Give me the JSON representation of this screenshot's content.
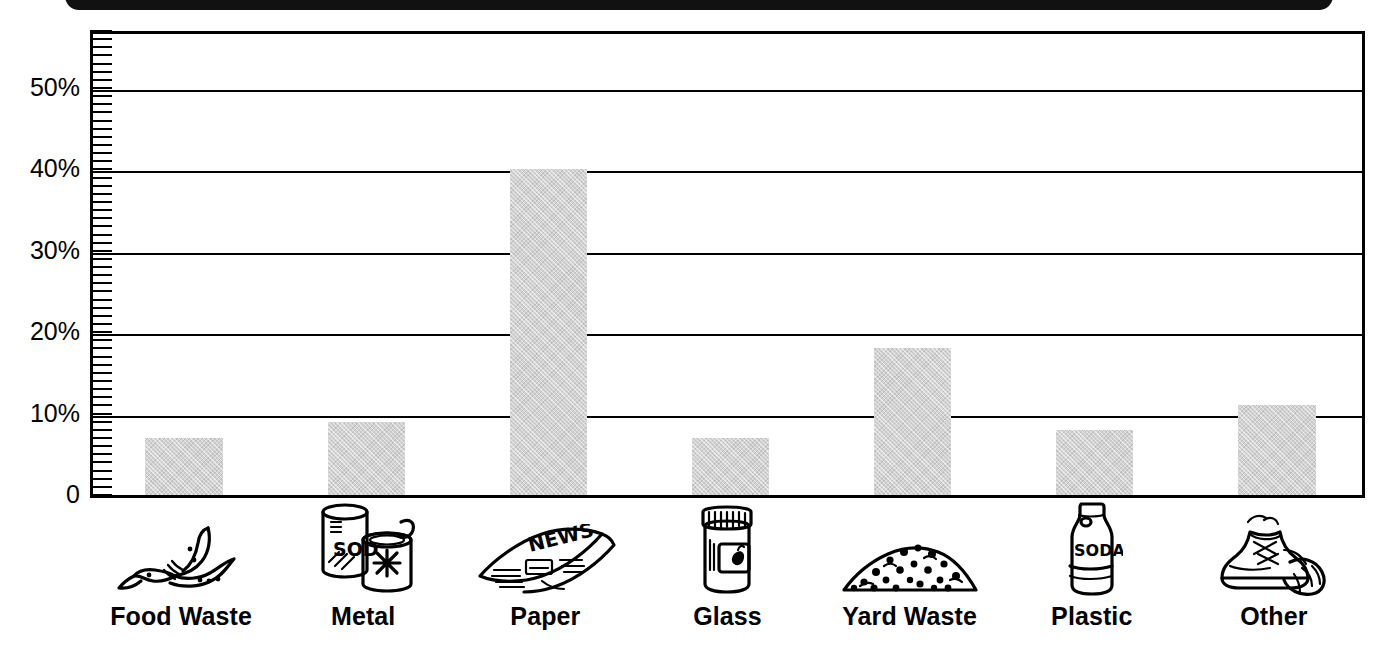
{
  "chart_data": {
    "type": "bar",
    "title": "",
    "subtitle": "",
    "xlabel": "",
    "ylabel": "",
    "categories": [
      "Food Waste",
      "Metal",
      "Paper",
      "Glass",
      "Yard Waste",
      "Plastic",
      "Other"
    ],
    "values": [
      7,
      9,
      40,
      7,
      18,
      8,
      11
    ],
    "value_unit": "%",
    "ylim": [
      0,
      57
    ],
    "ytick_values": [
      0,
      10,
      20,
      30,
      40,
      50
    ],
    "ytick_labels": [
      "0",
      "10%",
      "20%",
      "30%",
      "40%",
      "50%"
    ],
    "minor_ticks": true,
    "minor_tick_step": 1,
    "grid": "horizontal",
    "legend": "none",
    "bar_color": "#d2d2d2",
    "axis_color": "#000000",
    "background": "#ffffff",
    "icons": [
      {
        "category": "Food Waste",
        "icon_name": "banana-peel-icon"
      },
      {
        "category": "Metal",
        "icon_name": "soda-can-and-tin-can-icon",
        "text_on_icon": "SODA"
      },
      {
        "category": "Paper",
        "icon_name": "folded-newspaper-icon",
        "text_on_icon": "NEWS"
      },
      {
        "category": "Glass",
        "icon_name": "glass-jam-jar-icon"
      },
      {
        "category": "Yard Waste",
        "icon_name": "grass-clippings-pile-icon"
      },
      {
        "category": "Plastic",
        "icon_name": "plastic-soda-bottle-icon",
        "text_on_icon": "SODA"
      },
      {
        "category": "Other",
        "icon_name": "old-sneakers-icon"
      }
    ]
  },
  "decor": {
    "top_band_color": "#111111"
  }
}
